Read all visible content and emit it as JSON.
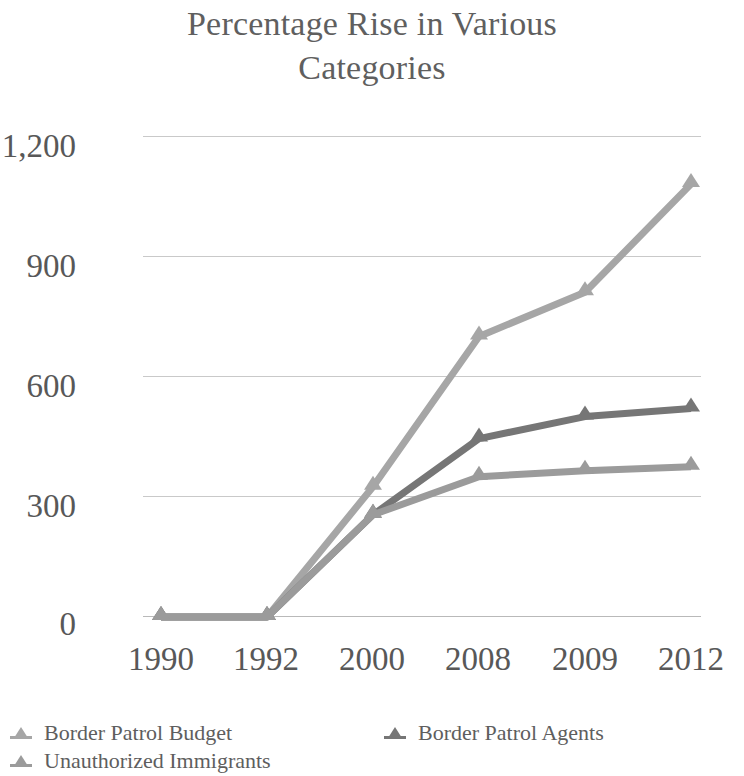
{
  "chart_data": {
    "type": "line",
    "title": "Percentage Rise in Various Categories",
    "xlabel": "",
    "ylabel": "",
    "categories": [
      "1990",
      "1992",
      "2000",
      "2008",
      "2009",
      "2012"
    ],
    "yticks": [
      "0",
      "300",
      "600",
      "900",
      "1,200"
    ],
    "ytick_values": [
      0,
      300,
      600,
      900,
      1200
    ],
    "ylim": [
      0,
      1200
    ],
    "grid": true,
    "legend_position": "bottom",
    "series": [
      {
        "name": "Border Patrol Budget",
        "color": "#a6a6a6",
        "values": [
          0,
          0,
          325,
          700,
          810,
          1080
        ]
      },
      {
        "name": "Border Patrol Agents",
        "color": "#767676",
        "values": [
          0,
          0,
          255,
          445,
          500,
          520
        ]
      },
      {
        "name": "Unauthorized Immigrants",
        "color": "#9b9b9b",
        "values": [
          0,
          0,
          255,
          350,
          365,
          375
        ]
      }
    ]
  },
  "title": {
    "line1": "Percentage Rise in Various",
    "line2": "Categories"
  },
  "axes": {
    "y_labels": [
      "1,200",
      "900",
      "600",
      "300",
      "0"
    ],
    "x_labels": [
      "1990",
      "1992",
      "2000",
      "2008",
      "2009",
      "2012"
    ]
  },
  "legend": {
    "items": [
      {
        "label": "Border Patrol Budget",
        "color": "#a6a6a6",
        "marker": "triangle-marker"
      },
      {
        "label": "Border Patrol Agents",
        "color": "#767676",
        "marker": "triangle-marker"
      },
      {
        "label": "Unauthorized Immigrants",
        "color": "#9b9b9b",
        "marker": "triangle-marker"
      }
    ]
  },
  "colors": {
    "title": "#5f5f5f",
    "tick": "#585858",
    "grid": "#c9c9c9",
    "background": "#ffffff"
  }
}
